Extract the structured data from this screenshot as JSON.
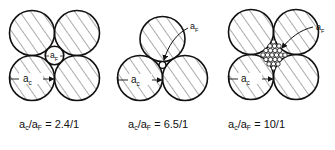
{
  "diagrams": [
    {
      "id": "square-packing",
      "label_large": "a",
      "label_large_sub": "c",
      "label_small": "a",
      "label_small_sub": "F",
      "ratio_text": "= 2.4/1",
      "caption_num": "a",
      "caption_num_sub": "c",
      "caption_den": "a",
      "caption_den_sub": "F"
    },
    {
      "id": "triangular-packing",
      "label_large": "a",
      "label_large_sub": "c",
      "label_small": "a",
      "label_small_sub": "F",
      "ratio_text": "= 6.5/1",
      "caption_num": "a",
      "caption_num_sub": "c",
      "caption_den": "a",
      "caption_den_sub": "F"
    },
    {
      "id": "square-packing-fine-fill",
      "label_large": "a",
      "label_large_sub": "c",
      "label_small": "a",
      "label_small_sub": "F",
      "ratio_text": "= 10/1",
      "caption_num": "a",
      "caption_num_sub": "c",
      "caption_den": "a",
      "caption_den_sub": "F"
    }
  ],
  "colors": {
    "stroke": "#111111",
    "hatch": "#333333",
    "background": "#ffffff"
  }
}
